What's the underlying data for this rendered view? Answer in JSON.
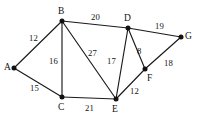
{
  "figure": {
    "kind": "weighted-undirected-graph",
    "background_color": "#ffffff",
    "ink_color": "#121212"
  },
  "nodes": [
    {
      "id": "A",
      "label": "A",
      "x": 14,
      "y": 68,
      "label_x": 4,
      "label_y": 63
    },
    {
      "id": "B",
      "label": "B",
      "x": 62,
      "y": 21,
      "label_x": 58,
      "label_y": 7
    },
    {
      "id": "C",
      "label": "C",
      "x": 62,
      "y": 97,
      "label_x": 58,
      "label_y": 103
    },
    {
      "id": "D",
      "label": "D",
      "x": 128,
      "y": 28,
      "label_x": 124,
      "label_y": 14
    },
    {
      "id": "E",
      "label": "E",
      "x": 116,
      "y": 99,
      "label_x": 112,
      "label_y": 105
    },
    {
      "id": "F",
      "label": "F",
      "x": 145,
      "y": 69,
      "label_x": 147,
      "label_y": 74
    },
    {
      "id": "G",
      "label": "G",
      "x": 181,
      "y": 37,
      "label_x": 185,
      "label_y": 32
    }
  ],
  "edges": [
    {
      "id": "A-B",
      "from": "A",
      "to": "B",
      "weight": "12",
      "label_x": 29,
      "label_y": 34
    },
    {
      "id": "A-C",
      "from": "A",
      "to": "C",
      "weight": "15",
      "label_x": 30,
      "label_y": 84
    },
    {
      "id": "B-C",
      "from": "B",
      "to": "C",
      "weight": "16",
      "label_x": 49,
      "label_y": 57
    },
    {
      "id": "B-D",
      "from": "B",
      "to": "D",
      "weight": "20",
      "label_x": 91,
      "label_y": 13
    },
    {
      "id": "B-E",
      "from": "B",
      "to": "E",
      "weight": "27",
      "label_x": 88,
      "label_y": 49
    },
    {
      "id": "C-E",
      "from": "C",
      "to": "E",
      "weight": "21",
      "label_x": 85,
      "label_y": 104
    },
    {
      "id": "D-E",
      "from": "D",
      "to": "E",
      "weight": "17",
      "label_x": 107,
      "label_y": 57
    },
    {
      "id": "D-F",
      "from": "D",
      "to": "F",
      "weight": "8",
      "label_x": 137,
      "label_y": 47
    },
    {
      "id": "D-G",
      "from": "D",
      "to": "G",
      "weight": "19",
      "label_x": 155,
      "label_y": 22
    },
    {
      "id": "E-F",
      "from": "E",
      "to": "F",
      "weight": "12",
      "label_x": 130,
      "label_y": 87
    },
    {
      "id": "F-G",
      "from": "F",
      "to": "G",
      "weight": "18",
      "label_x": 164,
      "label_y": 59
    }
  ]
}
